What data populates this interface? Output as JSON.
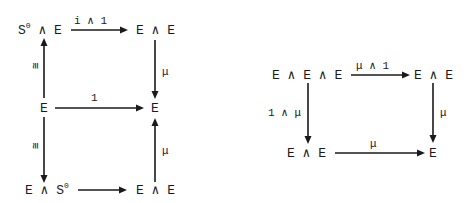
{
  "diagrams": [
    {
      "name": "unit-diagram",
      "nodes": {
        "top_left": {
          "base": "S",
          "sup": "0",
          "rest": " ∧ E"
        },
        "top_right": "E ∧ E",
        "middle_left": "E",
        "middle_right": "E",
        "bottom_left": {
          "base": "E ∧ S",
          "sup": "0"
        },
        "bottom_right": "E ∧ E"
      },
      "arrows": {
        "top": "i ∧ 1",
        "middle": "1",
        "right_upper": "μ",
        "right_lower": "μ",
        "left_upper": "≅",
        "left_lower": "≅"
      }
    },
    {
      "name": "associativity-diagram",
      "nodes": {
        "top_left": "E ∧ E ∧ E",
        "top_right": "E ∧ E",
        "bottom_left": "E ∧ E",
        "bottom_right": "E"
      },
      "arrows": {
        "top": "μ ∧ 1",
        "left": "1 ∧ μ",
        "right": "μ",
        "bottom": "μ"
      }
    }
  ]
}
